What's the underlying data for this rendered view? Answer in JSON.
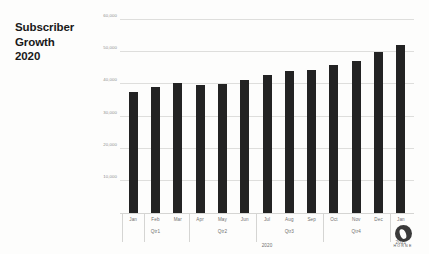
{
  "slide": {
    "title_lines": [
      "Subscriber",
      "Growth",
      "2020"
    ]
  },
  "logo": {
    "name": "horne-logo",
    "text": "HORNE"
  },
  "chart_data": {
    "type": "bar",
    "title": "Subscriber Growth 2020",
    "xlabel": "2020",
    "ylabel": "",
    "ylim": [
      0,
      60000
    ],
    "grid": true,
    "legend": "none",
    "bar_color": "#232323",
    "categories": [
      "Jan",
      "Feb",
      "Mar",
      "Apr",
      "May",
      "Jun",
      "Jul",
      "Aug",
      "Sep",
      "Oct",
      "Nov",
      "Dec",
      "Jan"
    ],
    "quarters": [
      "",
      "Qtr1",
      "",
      "",
      "Qtr2",
      "",
      "",
      "Qtr3",
      "",
      "",
      "Qtr4",
      "",
      "Qtr1"
    ],
    "years": [
      "",
      "",
      "",
      "",
      "",
      "",
      "",
      "",
      "",
      "",
      "",
      "",
      "2021"
    ],
    "values": [
      37500,
      39200,
      40300,
      39900,
      40000,
      41300,
      43000,
      44300,
      44500,
      46000,
      47200,
      50000,
      52200
    ],
    "yticks": [
      10000,
      20000,
      30000,
      40000,
      50000,
      60000
    ],
    "ytick_labels": [
      "10,000",
      "20,000",
      "30,000",
      "40,000",
      "50,000",
      "60,000"
    ]
  }
}
